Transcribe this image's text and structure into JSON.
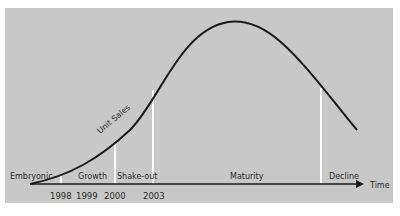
{
  "diagram": {
    "curve_label": "Unit Sales",
    "axis_label": "Time",
    "stages": [
      {
        "label": "Embryonic"
      },
      {
        "label": "Growth"
      },
      {
        "label": "Shake-out"
      },
      {
        "label": "Maturity"
      },
      {
        "label": "Decline"
      }
    ],
    "years": [
      "1998",
      "1999",
      "2000",
      "2003"
    ],
    "colors": {
      "background": "#c8c8c8",
      "curve": "#1a1a1a",
      "dividers": "#ffffff",
      "axis": "#1a1a1a"
    }
  }
}
